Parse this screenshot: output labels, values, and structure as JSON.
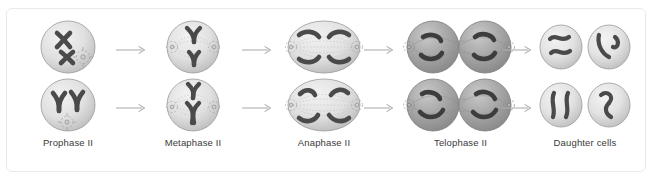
{
  "figure": {
    "title_visible": false,
    "stage_count": 5,
    "row_count": 2,
    "colors": {
      "cell_fill_light": "#e8e8e8",
      "cell_fill_mid": "#cfcfcf",
      "cell_edge": "#9a9a9a",
      "cell_fill_dark": "#9d9d9d",
      "chromosome": "#4a4a4a",
      "chromosome_dark": "#3d3d3d",
      "spindle": "#b4b4b4",
      "arrow": "#b0b0b0",
      "label_text": "#3a3a3a",
      "frame_border": "#e9e9e9",
      "background": "#ffffff"
    },
    "stages": [
      {
        "id": "prophase-2",
        "label": "Prophase II",
        "cell_shape": "round",
        "cell_tone": "light",
        "chromosome_form": "condensed-x",
        "chromosomes_per_cell": 2,
        "asters": 1,
        "spindle_visible": false,
        "cells_per_row": 1
      },
      {
        "id": "metaphase-2",
        "label": "Metaphase II",
        "cell_shape": "round",
        "cell_tone": "light",
        "chromosome_form": "condensed-x-aligned",
        "chromosomes_per_cell": 2,
        "asters": 2,
        "spindle_visible": true,
        "cells_per_row": 1
      },
      {
        "id": "anaphase-2",
        "label": "Anaphase II",
        "cell_shape": "oval-elongated",
        "cell_tone": "light",
        "chromosome_form": "separated-chromatids",
        "chromosomes_per_cell": 4,
        "asters": 2,
        "spindle_visible": true,
        "cells_per_row": 1
      },
      {
        "id": "telophase-2",
        "label": "Telophase II",
        "cell_shape": "double-lobed-furrow",
        "cell_tone": "dark",
        "chromosome_form": "clustered-chromatids",
        "chromosomes_per_cell": 4,
        "asters": 2,
        "spindle_visible": true,
        "cells_per_row": 2
      },
      {
        "id": "daughter-cells",
        "label": "Daughter cells",
        "cell_shape": "round-separate",
        "cell_tone": "light",
        "chromosome_form": "decondensed-squiggle",
        "chromosomes_per_cell": 2,
        "asters": 0,
        "spindle_visible": false,
        "cells_per_row": 2
      }
    ],
    "arrows": [
      {
        "id": "arrow-prophase-to-metaphase",
        "direction": "right"
      },
      {
        "id": "arrow-metaphase-to-anaphase",
        "direction": "right"
      },
      {
        "id": "arrow-anaphase-to-telophase",
        "direction": "right"
      },
      {
        "id": "arrow-telophase-to-daughter",
        "direction": "right"
      }
    ]
  }
}
